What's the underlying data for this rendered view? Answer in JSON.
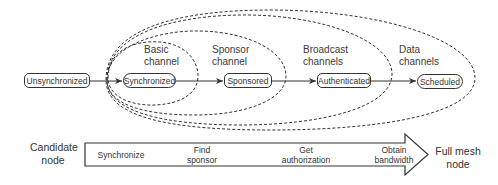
{
  "diagram": {
    "states": [
      {
        "id": "unsynchronized",
        "label": "Unsynchronized"
      },
      {
        "id": "synchronized",
        "label": "Synchronized"
      },
      {
        "id": "sponsored",
        "label": "Sponsored"
      },
      {
        "id": "authenticated",
        "label": "Authenticated"
      },
      {
        "id": "scheduled",
        "label": "Scheduled"
      }
    ],
    "transitions": [
      {
        "from": "unsynchronized",
        "to": "synchronized"
      },
      {
        "from": "synchronized",
        "to": "sponsored"
      },
      {
        "from": "sponsored",
        "to": "authenticated"
      },
      {
        "from": "authenticated",
        "to": "scheduled"
      }
    ],
    "channel_regions": [
      {
        "line1": "Basic",
        "line2": "channel"
      },
      {
        "line1": "Sponsor",
        "line2": "channel"
      },
      {
        "line1": "Broadcast",
        "line2": "channels"
      },
      {
        "line1": "Data",
        "line2": "channels"
      }
    ],
    "progress_arrow": {
      "start_label": {
        "line1": "Candidate",
        "line2": "node"
      },
      "end_label": {
        "line1": "Full mesh",
        "line2": "node"
      },
      "steps": [
        {
          "line1": "Synchronize",
          "line2": ""
        },
        {
          "line1": "Find",
          "line2": "sponsor"
        },
        {
          "line1": "Get",
          "line2": "authorization"
        },
        {
          "line1": "Obtain",
          "line2": "bandwidth"
        }
      ]
    },
    "colors": {
      "stroke": "#333333",
      "text": "#3a3a3a",
      "background": "#ffffff"
    }
  }
}
